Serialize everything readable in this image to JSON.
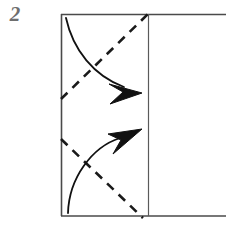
{
  "figure": {
    "kind": "origami-fold-step-diagram",
    "width": 226,
    "height": 233,
    "background_color": "#ffffff"
  },
  "step": {
    "number_label": "2",
    "number_color": "#6e6e6e"
  },
  "paper": {
    "name": "paper-outline",
    "stroke_color": "#4a4a4a",
    "stroke_width": 1.6,
    "left": 61,
    "top": 14,
    "right": 232,
    "bottom": 216,
    "note_cropped_right": true
  },
  "crease": {
    "name": "vertical-crease-line",
    "stroke_color": "#5a5a5a",
    "stroke_width": 1.2,
    "x": 148,
    "y_top": 14,
    "y_bottom": 216
  },
  "fold_lines": [
    {
      "id": "upper-dashed-fold-line",
      "style": "dashed",
      "meaning": "valley-fold",
      "stroke_color": "#1a1a1a",
      "stroke_width": 2.6,
      "dash_pattern": "9 7",
      "x1": 61,
      "y1": 99,
      "x2": 149,
      "y2": 13
    },
    {
      "id": "lower-dashed-fold-line",
      "style": "dashed",
      "meaning": "valley-fold",
      "stroke_color": "#1a1a1a",
      "stroke_width": 2.6,
      "dash_pattern": "9 7",
      "x1": 61,
      "y1": 139,
      "x2": 143,
      "y2": 218
    }
  ],
  "arrows": [
    {
      "id": "upper-fold-arrow",
      "direction": "down-right",
      "stroke_color": "#111111",
      "stroke_width": 1.8,
      "fill_color": "#111111",
      "path": "M66,18 C74,52 96,78 133,90",
      "tip_x": 141,
      "tip_y": 92,
      "head_angle_deg": 22
    },
    {
      "id": "lower-fold-arrow",
      "direction": "up-right",
      "stroke_color": "#111111",
      "stroke_width": 1.8,
      "fill_color": "#111111",
      "path": "M68,213 C70,180 92,146 128,135",
      "tip_x": 141,
      "tip_y": 130,
      "head_angle_deg": -20
    }
  ]
}
